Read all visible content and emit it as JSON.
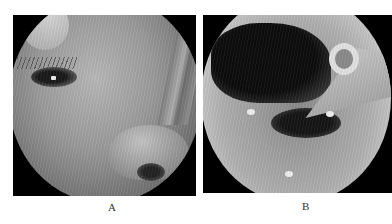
{
  "figure": {
    "panels": [
      {
        "id": "A",
        "label": "A",
        "description": "Circular endoscopic view of a face: eye with lashes, nose and nostril, tubing at right edge"
      },
      {
        "id": "B",
        "label": "B",
        "description": "Circular endoscopic view of an airway lumen with a tube/instrument tip (ring) at upper right"
      }
    ]
  }
}
